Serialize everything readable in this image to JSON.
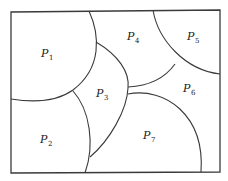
{
  "diagram": {
    "type": "region-partition",
    "regions": [
      {
        "id": "P1",
        "letter": "P",
        "subscript": "1"
      },
      {
        "id": "P2",
        "letter": "P",
        "subscript": "2"
      },
      {
        "id": "P3",
        "letter": "P",
        "subscript": "3"
      },
      {
        "id": "P4",
        "letter": "P",
        "subscript": "4"
      },
      {
        "id": "P5",
        "letter": "P",
        "subscript": "5"
      },
      {
        "id": "P6",
        "letter": "P",
        "subscript": "6"
      },
      {
        "id": "P7",
        "letter": "P",
        "subscript": "7"
      }
    ],
    "line_color": "#3a3a3a",
    "text_color": "#1a1a1a"
  }
}
